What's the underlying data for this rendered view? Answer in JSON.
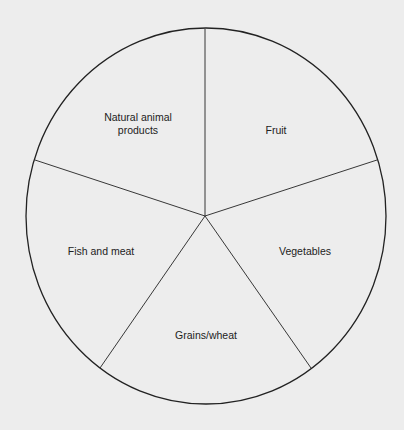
{
  "diagram": {
    "type": "pie-division",
    "segments": [
      {
        "label": "Natural animal\nproducts",
        "x": 133,
        "y": 124
      },
      {
        "label": "Fruit",
        "x": 276,
        "y": 130
      },
      {
        "label": "Vegetables",
        "x": 305,
        "y": 250
      },
      {
        "label": "Grains/wheat",
        "x": 206,
        "y": 335
      },
      {
        "label": "Fish and meat",
        "x": 101,
        "y": 250
      }
    ],
    "colors": {
      "background": "#ededed",
      "line": "#222222"
    }
  }
}
